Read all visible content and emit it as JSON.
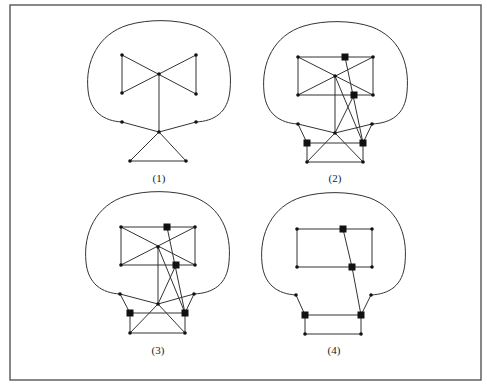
{
  "figure": {
    "frame": {
      "x1": 10,
      "y1": 5,
      "x2": 481,
      "y2": 380,
      "color": "#555555"
    },
    "panels": [
      {
        "id": "1",
        "caption": "(1)",
        "caption_pos": [
          159,
          182
        ],
        "outline": "M122,122 C104,121 90,112 88,90 C85,62 98,34 128,25 C148,19 176,19 196,26 C222,36 233,60 230,90 C228,113 214,121 196,122",
        "nodes": [
          {
            "id": "a",
            "x": 122,
            "y": 55,
            "type": "dot"
          },
          {
            "id": "b",
            "x": 196,
            "y": 55,
            "type": "dot"
          },
          {
            "id": "c",
            "x": 159,
            "y": 74,
            "type": "dot"
          },
          {
            "id": "d",
            "x": 122,
            "y": 93,
            "type": "dot"
          },
          {
            "id": "e",
            "x": 196,
            "y": 94,
            "type": "dot"
          },
          {
            "id": "nl",
            "x": 122,
            "y": 122,
            "type": "dot"
          },
          {
            "id": "nr",
            "x": 196,
            "y": 122,
            "type": "dot"
          },
          {
            "id": "ap",
            "x": 159,
            "y": 132,
            "type": "dot"
          },
          {
            "id": "bl",
            "x": 130,
            "y": 161,
            "type": "dot"
          },
          {
            "id": "br",
            "x": 186,
            "y": 161,
            "type": "dot"
          }
        ],
        "edges": [
          [
            "a",
            "d"
          ],
          [
            "b",
            "e"
          ],
          [
            "a",
            "e"
          ],
          [
            "b",
            "d"
          ],
          [
            "c",
            "ap"
          ],
          [
            "nl",
            "ap"
          ],
          [
            "nr",
            "ap"
          ],
          [
            "ap",
            "bl"
          ],
          [
            "ap",
            "br"
          ],
          [
            "bl",
            "br"
          ]
        ]
      },
      {
        "id": "2",
        "caption": "(2)",
        "caption_pos": [
          335,
          182
        ],
        "outline": "M298,124 C280,123 266,114 264,92 C261,63 274,35 304,26 C324,20 352,20 372,27 C398,37 410,61 407,92 C405,115 391,123 372,124",
        "nodes": [
          {
            "id": "tl",
            "x": 298,
            "y": 57,
            "type": "dot"
          },
          {
            "id": "st",
            "x": 345,
            "y": 57,
            "type": "square"
          },
          {
            "id": "tr",
            "x": 373,
            "y": 57,
            "type": "dot"
          },
          {
            "id": "c",
            "x": 335,
            "y": 76,
            "type": "dot"
          },
          {
            "id": "bl",
            "x": 298,
            "y": 95,
            "type": "dot"
          },
          {
            "id": "sm",
            "x": 354,
            "y": 95,
            "type": "square"
          },
          {
            "id": "br",
            "x": 373,
            "y": 95,
            "type": "dot"
          },
          {
            "id": "nl",
            "x": 298,
            "y": 124,
            "type": "dot"
          },
          {
            "id": "nr",
            "x": 372,
            "y": 124,
            "type": "dot"
          },
          {
            "id": "ap",
            "x": 335,
            "y": 133,
            "type": "dot"
          },
          {
            "id": "sl",
            "x": 307,
            "y": 143,
            "type": "square"
          },
          {
            "id": "sr",
            "x": 363,
            "y": 143,
            "type": "square"
          },
          {
            "id": "ql",
            "x": 307,
            "y": 162,
            "type": "dot"
          },
          {
            "id": "qr",
            "x": 363,
            "y": 162,
            "type": "dot"
          }
        ],
        "edges": [
          [
            "tl",
            "st"
          ],
          [
            "st",
            "tr"
          ],
          [
            "tl",
            "bl"
          ],
          [
            "tr",
            "br"
          ],
          [
            "bl",
            "sm"
          ],
          [
            "sm",
            "br"
          ],
          [
            "tl",
            "br"
          ],
          [
            "tr",
            "bl"
          ],
          [
            "c",
            "ap"
          ],
          [
            "c",
            "sr"
          ],
          [
            "sm",
            "ap"
          ],
          [
            "st",
            "sr"
          ],
          [
            "nl",
            "ap"
          ],
          [
            "nr",
            "ap"
          ],
          [
            "nl",
            "sl"
          ],
          [
            "nr",
            "sr"
          ],
          [
            "sl",
            "sr"
          ],
          [
            "sl",
            "ql"
          ],
          [
            "sr",
            "qr"
          ],
          [
            "ql",
            "qr"
          ],
          [
            "ap",
            "ql"
          ],
          [
            "ap",
            "qr"
          ]
        ]
      },
      {
        "id": "3",
        "caption": "(3)",
        "caption_pos": [
          158,
          354
        ],
        "outline": "M120,294 C102,293 88,284 86,262 C83,233 96,205 126,196 C146,190 174,190 194,197 C220,207 232,231 229,262 C227,285 213,293 194,294",
        "nodes": [
          {
            "id": "tl",
            "x": 121,
            "y": 227,
            "type": "dot"
          },
          {
            "id": "st",
            "x": 167,
            "y": 227,
            "type": "square"
          },
          {
            "id": "tr",
            "x": 195,
            "y": 227,
            "type": "dot"
          },
          {
            "id": "c",
            "x": 158,
            "y": 247,
            "type": "dot"
          },
          {
            "id": "bl",
            "x": 121,
            "y": 265,
            "type": "dot"
          },
          {
            "id": "sm",
            "x": 176,
            "y": 265,
            "type": "square"
          },
          {
            "id": "br",
            "x": 195,
            "y": 265,
            "type": "dot"
          },
          {
            "id": "nl",
            "x": 120,
            "y": 294,
            "type": "dot"
          },
          {
            "id": "nr",
            "x": 194,
            "y": 294,
            "type": "dot"
          },
          {
            "id": "ap",
            "x": 158,
            "y": 304,
            "type": "dot"
          },
          {
            "id": "sl",
            "x": 130,
            "y": 313,
            "type": "square"
          },
          {
            "id": "sr",
            "x": 185,
            "y": 313,
            "type": "square"
          },
          {
            "id": "ql",
            "x": 130,
            "y": 333,
            "type": "dot"
          },
          {
            "id": "qr",
            "x": 185,
            "y": 333,
            "type": "dot"
          }
        ],
        "edges": [
          [
            "tl",
            "st"
          ],
          [
            "st",
            "tr"
          ],
          [
            "tl",
            "bl"
          ],
          [
            "tr",
            "br"
          ],
          [
            "bl",
            "sm"
          ],
          [
            "sm",
            "br"
          ],
          [
            "tl",
            "br"
          ],
          [
            "tr",
            "bl"
          ],
          [
            "c",
            "ap"
          ],
          [
            "c",
            "sr"
          ],
          [
            "sm",
            "ap"
          ],
          [
            "st",
            "sr"
          ],
          [
            "nl",
            "ap"
          ],
          [
            "nr",
            "ap"
          ],
          [
            "nl",
            "sl"
          ],
          [
            "nr",
            "sr"
          ],
          [
            "sl",
            "sr"
          ],
          [
            "sl",
            "ql"
          ],
          [
            "sr",
            "qr"
          ],
          [
            "ql",
            "qr"
          ],
          [
            "ap",
            "ql"
          ],
          [
            "ap",
            "qr"
          ]
        ]
      },
      {
        "id": "4",
        "caption": "(4)",
        "caption_pos": [
          334,
          354
        ],
        "outline": "M296,295 C278,294 264,285 262,263 C259,234 272,206 302,197 C322,191 350,191 370,198 C396,208 408,232 405,263 C403,286 389,294 371,295",
        "nodes": [
          {
            "id": "tl",
            "x": 297,
            "y": 229,
            "type": "dot"
          },
          {
            "id": "st",
            "x": 343,
            "y": 229,
            "type": "square"
          },
          {
            "id": "tr",
            "x": 372,
            "y": 229,
            "type": "dot"
          },
          {
            "id": "bl",
            "x": 297,
            "y": 267,
            "type": "dot"
          },
          {
            "id": "sm",
            "x": 352,
            "y": 267,
            "type": "square"
          },
          {
            "id": "br",
            "x": 372,
            "y": 267,
            "type": "dot"
          },
          {
            "id": "nl",
            "x": 296,
            "y": 295,
            "type": "dot"
          },
          {
            "id": "nr",
            "x": 371,
            "y": 295,
            "type": "dot"
          },
          {
            "id": "sl",
            "x": 305,
            "y": 315,
            "type": "square"
          },
          {
            "id": "sr",
            "x": 361,
            "y": 315,
            "type": "square"
          },
          {
            "id": "ql",
            "x": 305,
            "y": 334,
            "type": "dot"
          },
          {
            "id": "qr",
            "x": 361,
            "y": 334,
            "type": "dot"
          }
        ],
        "edges": [
          [
            "tl",
            "st"
          ],
          [
            "st",
            "tr"
          ],
          [
            "tl",
            "bl"
          ],
          [
            "tr",
            "br"
          ],
          [
            "bl",
            "sm"
          ],
          [
            "sm",
            "br"
          ],
          [
            "st",
            "sm"
          ],
          [
            "sm",
            "sr"
          ],
          [
            "nl",
            "sl"
          ],
          [
            "nr",
            "sr"
          ],
          [
            "sl",
            "sr"
          ],
          [
            "sl",
            "ql"
          ],
          [
            "sr",
            "qr"
          ],
          [
            "ql",
            "qr"
          ]
        ]
      }
    ]
  }
}
